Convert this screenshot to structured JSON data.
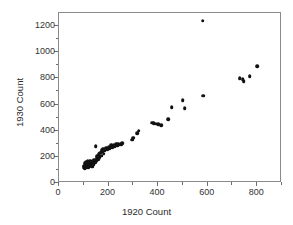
{
  "chart_data": {
    "type": "scatter",
    "title": "",
    "xlabel": "1920 Count",
    "ylabel": "1930 Count",
    "xlim": [
      0,
      900
    ],
    "ylim": [
      0,
      1300
    ],
    "xticks": [
      0,
      200,
      400,
      600,
      800
    ],
    "yticks": [
      0,
      200,
      400,
      600,
      800,
      1000,
      1200
    ],
    "xticks_minor": [
      100,
      300,
      500,
      700,
      900
    ],
    "yticks_minor": [
      100,
      300,
      500,
      700,
      900,
      1100
    ],
    "grid": false,
    "legend": null,
    "marker": {
      "shape": "circle",
      "color": "#111111",
      "size": 3.6
    },
    "frame_color": "#8a8a8a",
    "points": [
      [
        100,
        120
      ],
      [
        102,
        133
      ],
      [
        104,
        112
      ],
      [
        105,
        150
      ],
      [
        106,
        128
      ],
      [
        108,
        142
      ],
      [
        110,
        118
      ],
      [
        110,
        160
      ],
      [
        112,
        135
      ],
      [
        114,
        127
      ],
      [
        115,
        148
      ],
      [
        116,
        168
      ],
      [
        118,
        122
      ],
      [
        120,
        140
      ],
      [
        121,
        155
      ],
      [
        123,
        130
      ],
      [
        125,
        172
      ],
      [
        126,
        145
      ],
      [
        128,
        138
      ],
      [
        130,
        158
      ],
      [
        132,
        148
      ],
      [
        134,
        126
      ],
      [
        136,
        165
      ],
      [
        138,
        152
      ],
      [
        140,
        144
      ],
      [
        142,
        178
      ],
      [
        145,
        160
      ],
      [
        148,
        283
      ],
      [
        150,
        170
      ],
      [
        152,
        190
      ],
      [
        155,
        205
      ],
      [
        158,
        182
      ],
      [
        160,
        218
      ],
      [
        163,
        196
      ],
      [
        166,
        232
      ],
      [
        170,
        210
      ],
      [
        172,
        253
      ],
      [
        175,
        238
      ],
      [
        178,
        262
      ],
      [
        180,
        225
      ],
      [
        185,
        247
      ],
      [
        190,
        270
      ],
      [
        195,
        258
      ],
      [
        200,
        276
      ],
      [
        205,
        265
      ],
      [
        210,
        288
      ],
      [
        215,
        272
      ],
      [
        220,
        290
      ],
      [
        225,
        281
      ],
      [
        230,
        295
      ],
      [
        235,
        286
      ],
      [
        240,
        300
      ],
      [
        245,
        292
      ],
      [
        250,
        298
      ],
      [
        255,
        305
      ],
      [
        295,
        330
      ],
      [
        300,
        345
      ],
      [
        315,
        380
      ],
      [
        322,
        400
      ],
      [
        375,
        462
      ],
      [
        382,
        458
      ],
      [
        390,
        452
      ],
      [
        400,
        448
      ],
      [
        412,
        442
      ],
      [
        440,
        488
      ],
      [
        455,
        578
      ],
      [
        500,
        632
      ],
      [
        508,
        570
      ],
      [
        580,
        1240
      ],
      [
        582,
        668
      ],
      [
        730,
        802
      ],
      [
        742,
        795
      ],
      [
        745,
        778
      ],
      [
        770,
        818
      ],
      [
        800,
        893
      ]
    ]
  },
  "axes": {
    "x_title": "1920 Count",
    "y_title": "1930 Count",
    "x_tick_labels": [
      "0",
      "200",
      "400",
      "600",
      "800"
    ],
    "y_tick_labels": [
      "0",
      "200",
      "400",
      "600",
      "800",
      "1000",
      "1200"
    ]
  }
}
